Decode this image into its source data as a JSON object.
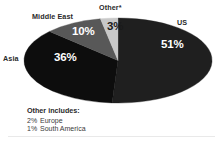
{
  "chart_data": {
    "type": "pie",
    "title": "",
    "subtitle": "",
    "xlabel": "",
    "ylabel": "",
    "legend_position": "none",
    "grid": false,
    "labels_inside": true,
    "categories": [
      "US",
      "Asia",
      "Middle East",
      "Other*"
    ],
    "values": [
      51,
      36,
      10,
      3
    ],
    "value_labels": [
      "51%",
      "36%",
      "10%",
      "3%"
    ],
    "units": "percent",
    "slices": [
      {
        "name": "US",
        "label": "US",
        "value": 51,
        "value_label": "51%",
        "color": "#1f1f1f",
        "label_color": "#ffffff"
      },
      {
        "name": "Asia",
        "label": "Asia",
        "value": 36,
        "value_label": "36%",
        "color": "#0d0d0d",
        "label_color": "#ffffff"
      },
      {
        "name": "Middle East",
        "label": "Middle East",
        "value": 10,
        "value_label": "10%",
        "color": "#585858",
        "label_color": "#ffffff"
      },
      {
        "name": "Other",
        "label": "Other*",
        "value": 3,
        "value_label": "3%",
        "color": "#c8c8c8",
        "label_color": "#1a1a1a"
      }
    ],
    "annotations": {
      "footnote_heading": "Other includes:",
      "footnote_items": [
        {
          "percent": "2%",
          "name": "Europe"
        },
        {
          "percent": "1%",
          "name": "South America"
        }
      ]
    },
    "colors": {
      "background": "#ffffff",
      "us": "#1f1f1f",
      "asia": "#0d0d0d",
      "middle_east": "#585858",
      "other": "#c8c8c8",
      "text": "#2a2a2a"
    }
  }
}
